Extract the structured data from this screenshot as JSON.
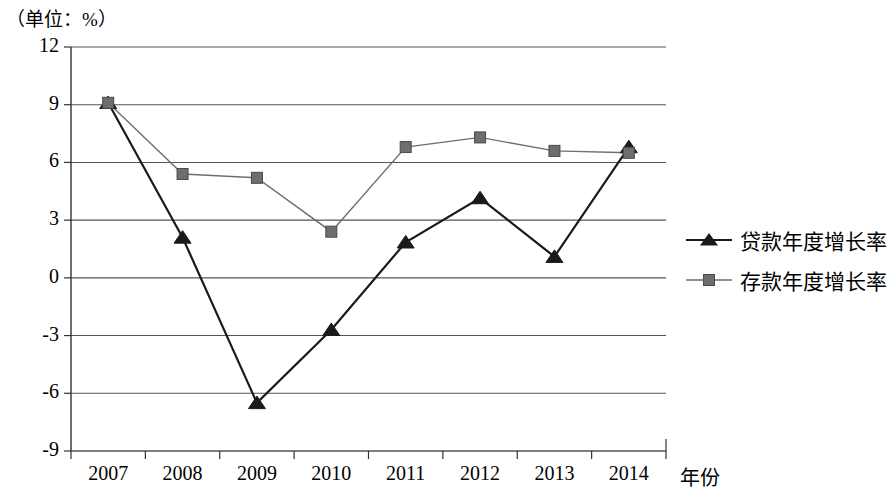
{
  "unit_label": "（单位：%）",
  "axis": {
    "x_name": "年份",
    "y_ticks": [
      "12",
      "9",
      "6",
      "3",
      "0",
      "-3",
      "-6",
      "-9"
    ],
    "x_ticks": [
      "2007",
      "2008",
      "2009",
      "2010",
      "2011",
      "2012",
      "2013",
      "2014"
    ]
  },
  "legend": {
    "items": [
      {
        "label": "贷款年度增长率",
        "marker": "triangle-marker",
        "color": "#1a1a1a"
      },
      {
        "label": "存款年度增长率",
        "marker": "square-marker",
        "color": "#6e6e6e"
      }
    ]
  },
  "colors": {
    "loan_series": "#1a1a1a",
    "deposit_series": "#6e6e6e",
    "gridline": "#555555",
    "axis": "#333333"
  },
  "chart_data": {
    "type": "line",
    "title": "",
    "subtitle": "",
    "xlabel": "年份",
    "ylabel": "（单位：%）",
    "categories": [
      "2007",
      "2008",
      "2009",
      "2010",
      "2011",
      "2012",
      "2013",
      "2014"
    ],
    "ylim": [
      -9,
      12
    ],
    "y_ticks": [
      12,
      9,
      6,
      3,
      0,
      -3,
      -6,
      -9
    ],
    "grid": true,
    "legend_position": "right",
    "series": [
      {
        "name": "贷款年度增长率",
        "marker": "triangle",
        "color": "#1a1a1a",
        "values": [
          9.1,
          2.1,
          -6.5,
          -2.7,
          1.85,
          4.15,
          1.1,
          6.8
        ]
      },
      {
        "name": "存款年度增长率",
        "marker": "square",
        "color": "#6e6e6e",
        "values": [
          9.1,
          5.4,
          5.2,
          2.4,
          6.8,
          7.3,
          6.6,
          6.5
        ]
      }
    ]
  }
}
